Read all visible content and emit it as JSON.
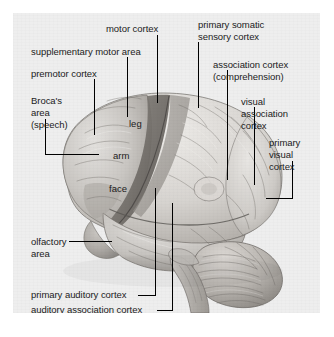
{
  "figure": {
    "panel_background": "#eeeeee",
    "page_background": "#ffffff",
    "leader_line_color": "#000000",
    "label_color": "#1b1b1b"
  },
  "labels": [
    {
      "id": "motor-cortex",
      "text": "motor cortex"
    },
    {
      "id": "supplementary-motor-area",
      "text": "supplementary motor area"
    },
    {
      "id": "premotor-cortex",
      "text": "premotor cortex"
    },
    {
      "id": "brocas-area-line1",
      "text": "Broca's"
    },
    {
      "id": "brocas-area-line2",
      "text": "area"
    },
    {
      "id": "brocas-area-line3",
      "text": "(speech)"
    },
    {
      "id": "primary-somatic-line1",
      "text": "primary somatic"
    },
    {
      "id": "primary-somatic-line2",
      "text": "sensory cortex"
    },
    {
      "id": "association-cortex-line1",
      "text": "association cortex"
    },
    {
      "id": "association-cortex-line2",
      "text": "(comprehension)"
    },
    {
      "id": "visual-association-line1",
      "text": "visual"
    },
    {
      "id": "visual-association-line2",
      "text": "association"
    },
    {
      "id": "visual-association-line3",
      "text": "cortex"
    },
    {
      "id": "primary-visual-line1",
      "text": "primary"
    },
    {
      "id": "primary-visual-line2",
      "text": "visual"
    },
    {
      "id": "primary-visual-line3",
      "text": "cortex"
    },
    {
      "id": "olfactory-area-line1",
      "text": "olfactory"
    },
    {
      "id": "olfactory-area-line2",
      "text": "area"
    },
    {
      "id": "primary-auditory-cortex",
      "text": "primary auditory cortex"
    },
    {
      "id": "auditory-association-cortex",
      "text": "auditory association cortex"
    }
  ],
  "homunculus_labels": [
    {
      "id": "leg",
      "text": "leg"
    },
    {
      "id": "arm",
      "text": "arm"
    },
    {
      "id": "face",
      "text": "face"
    }
  ],
  "text": {
    "motor_cortex": "motor cortex",
    "supplementary_motor_area": "supplementary motor area",
    "premotor_cortex": "premotor cortex",
    "brocas_1": "Broca's",
    "brocas_2": "area",
    "brocas_3": "(speech)",
    "somatic_1": "primary somatic",
    "somatic_2": "sensory cortex",
    "assoc_1": "association cortex",
    "assoc_2": "(comprehension)",
    "visassoc_1": "visual",
    "visassoc_2": "association",
    "visassoc_3": "cortex",
    "primvis_1": "primary",
    "primvis_2": "visual",
    "primvis_3": "cortex",
    "olf_1": "olfactory",
    "olf_2": "area",
    "prim_aud": "primary auditory cortex",
    "aud_assoc": "auditory association cortex",
    "leg": "leg",
    "arm": "arm",
    "face": "face"
  }
}
